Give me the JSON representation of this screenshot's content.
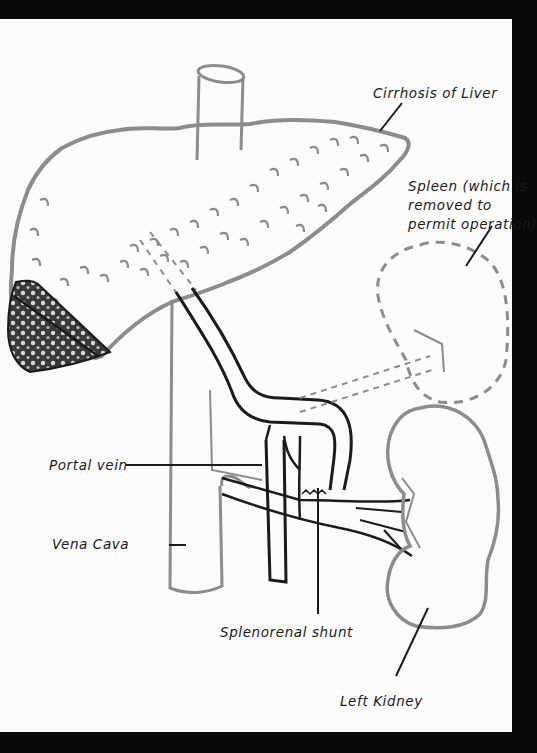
{
  "diagram": {
    "labels": {
      "cirrhosis": "Cirrhosis of Liver",
      "spleen_line1": "Spleen (which is",
      "spleen_line2": "removed to",
      "spleen_line3": "permit operation)",
      "portal_vein": "Portal vein",
      "vena_cava": "Vena Cava",
      "shunt": "Splenorenal shunt",
      "kidney": "Left Kidney"
    },
    "colors": {
      "background_frame": "#0a0a0a",
      "page": "#fbfbfa",
      "outline_gray": "#8c8c8c",
      "ink": "#1b1b1b",
      "liver_cut_section": "#3a3a3a"
    }
  }
}
